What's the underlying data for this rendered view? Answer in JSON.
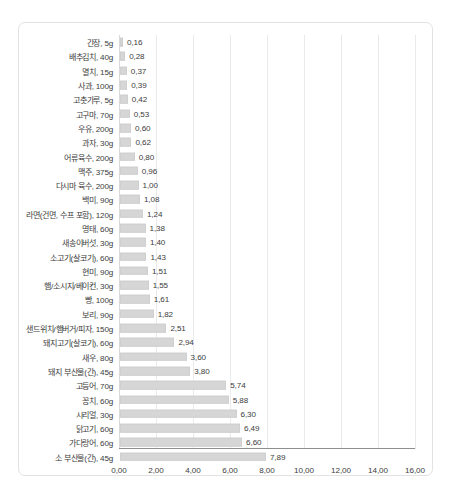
{
  "chart_data": {
    "type": "bar",
    "orientation": "horizontal",
    "title": "",
    "subtitle": "",
    "xlabel": "",
    "ylabel": "",
    "xlim": [
      0.0,
      16.0
    ],
    "xticks": [
      0.0,
      2.0,
      4.0,
      6.0,
      8.0,
      10.0,
      12.0,
      14.0,
      16.0
    ],
    "xtick_labels": [
      "0,00",
      "2,00",
      "4,00",
      "6,00",
      "8,00",
      "10,00",
      "12,00",
      "14,00",
      "16,00"
    ],
    "grid": true,
    "legend": false,
    "decimal_separator": ",",
    "bar_color": "#d6d6d6",
    "bar_border_color": "#cfcfcf",
    "axis_color": "#8f8f8f",
    "gridline_color": "#eaeaea",
    "frame_color": "#e2e2e2",
    "text_color": "#3d3d3d",
    "categories": [
      "간장, 5g",
      "배추김치, 40g",
      "멸치, 15g",
      "사과, 100g",
      "고춧가루, 5g",
      "고구마, 70g",
      "우유, 200g",
      "과자, 30g",
      "어류육수, 200g",
      "맥주, 375g",
      "다시마 육수, 200g",
      "백미, 90g",
      "라면(건면, 수프 포함), 120g",
      "명태, 60g",
      "새송이버섯, 30g",
      "소고기(살코기), 60g",
      "현미, 90g",
      "햄/소시지/베이컨, 30g",
      "빵, 100g",
      "보리, 90g",
      "샌드위치/햄버거/피자, 150g",
      "돼지고기(살코기), 60g",
      "새우, 80g",
      "돼지 부산물(간), 45g",
      "고등어, 70g",
      "꽁치, 60g",
      "시리얼, 30g",
      "닭고기, 60g",
      "가다랑어, 60g",
      "소 부산물(간), 45g"
    ],
    "values": [
      0.16,
      0.28,
      0.37,
      0.39,
      0.42,
      0.53,
      0.6,
      0.62,
      0.8,
      0.96,
      1.0,
      1.08,
      1.24,
      1.38,
      1.4,
      1.43,
      1.51,
      1.55,
      1.61,
      1.82,
      2.51,
      2.94,
      3.6,
      3.8,
      5.74,
      5.88,
      6.3,
      6.49,
      6.6,
      7.89
    ],
    "value_labels": [
      "0,16",
      "0,28",
      "0,37",
      "0,39",
      "0,42",
      "0,53",
      "0,60",
      "0,62",
      "0,80",
      "0,96",
      "1,00",
      "1,08",
      "1,24",
      "1,38",
      "1,40",
      "1,43",
      "1,51",
      "1,55",
      "1,61",
      "1,82",
      "2,51",
      "2,94",
      "3,60",
      "3,80",
      "5,74",
      "5,88",
      "6,30",
      "6,49",
      "6,60",
      "7,89"
    ]
  }
}
